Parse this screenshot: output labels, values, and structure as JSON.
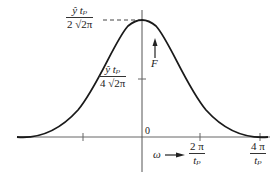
{
  "figure": {
    "type": "function-plot",
    "peak_label": {
      "num": "ŷ tₚ",
      "den": "2 √2π"
    },
    "half_label": {
      "num": "ŷ tₚ",
      "den": "4 √2π"
    },
    "origin_label": "0",
    "y_axis_label": "F",
    "x_axis_label": "ω",
    "x_ticks": [
      {
        "num": "2 π",
        "den": "tₚ"
      },
      {
        "num": "4 π",
        "den": "tₚ"
      }
    ],
    "colors": {
      "curve": "#1a1a1a",
      "axis": "#555555",
      "dashed": "#444444"
    }
  }
}
